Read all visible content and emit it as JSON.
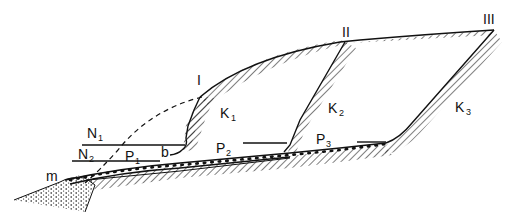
{
  "diagram": {
    "type": "geological cross-section",
    "profile_labels": {
      "I": "I",
      "II": "II",
      "III": "III"
    },
    "slopes": [
      {
        "base": "K",
        "sub": "1"
      },
      {
        "base": "K",
        "sub": "2"
      },
      {
        "base": "K",
        "sub": "3"
      }
    ],
    "platforms": [
      {
        "base": "P",
        "sub": "1"
      },
      {
        "base": "P",
        "sub": "2"
      },
      {
        "base": "P",
        "sub": "3"
      }
    ],
    "levels": [
      {
        "base": "N",
        "sub": "1"
      },
      {
        "base": "N",
        "sub": "2"
      }
    ],
    "point_b": "b",
    "point_m": "m",
    "colors": {
      "ink": "#111111",
      "background": "#ffffff"
    }
  }
}
